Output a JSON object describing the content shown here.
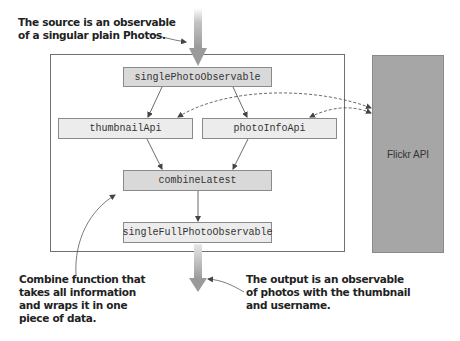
{
  "annotations": {
    "source": [
      "The source is an observable",
      "of a singular plain Photos."
    ],
    "combine": [
      "Combine function that",
      "takes all information",
      "and wraps it in one",
      "piece of data."
    ],
    "output": [
      "The output is an observable",
      "of photos with the thumbnail",
      "and username."
    ]
  },
  "nodes": {
    "single_photo_observable": "singlePhotoObservable",
    "thumbnail_api": "thumbnailApi",
    "photo_info_api": "photoInfoApi",
    "combine_latest": "combineLatest",
    "single_full_photo_observable": "singleFullPhotoObservable"
  },
  "external": {
    "flickr_api": "Flickr API"
  },
  "colors": {
    "node_dark": "#d9d9d9",
    "node_light": "#ececec",
    "flickr_fill": "#a6a6a6",
    "stream_arrow": "#a8a8a8",
    "line": "#444444"
  }
}
